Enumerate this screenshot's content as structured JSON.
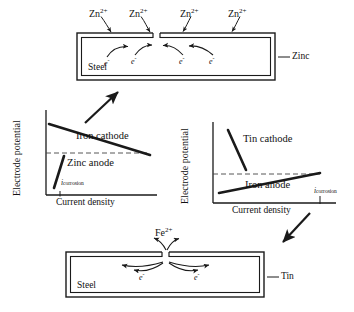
{
  "top_diagram": {
    "name": "galvanized-steel-diagram",
    "substrate_label": "Steel",
    "coating_label": "Zinc",
    "ion_labels": [
      "Zn2+",
      "Zn2+",
      "Zn2+",
      "Zn2+"
    ],
    "ion_display": "Zn",
    "ion_charge": "2+",
    "electron_label": "e",
    "electron_charge": "-",
    "electron_count": 4,
    "electron_direction": "toward-coating-gap"
  },
  "bottom_diagram": {
    "name": "tinplate-steel-diagram",
    "substrate_label": "Steel",
    "coating_label": "Tin",
    "ion_labels": [
      "Fe2+"
    ],
    "ion_display": "Fe",
    "ion_charge": "2+",
    "electron_label": "e",
    "electron_charge": "-",
    "electron_count": 2,
    "electron_direction": "away-from-coating-gap"
  },
  "left_chart": {
    "name": "zinc-polarization-chart",
    "ylabel": "Electrode potential",
    "xlabel": "Current density",
    "cathode_label": "Iron cathode",
    "anode_label": "Zinc anode",
    "corrosion_label": "i",
    "corrosion_subscript": "corrosion",
    "cathode_slope": "shallow-descending",
    "anode_slope": "steep-ascending",
    "intersection_position": "right"
  },
  "right_chart": {
    "name": "tin-polarization-chart",
    "ylabel": "Electrode potential",
    "xlabel": "Current density",
    "cathode_label": "Tin cathode",
    "anode_label": "Iron anode",
    "corrosion_label": "i",
    "corrosion_subscript": "corrosion",
    "cathode_slope": "steep-descending",
    "anode_slope": "shallow-ascending",
    "intersection_position": "far-right"
  },
  "connectors": {
    "left_to_top": "arrow-up-right",
    "right_to_bottom": "arrow-down-left"
  },
  "colors": {
    "line": "#1a1a1a",
    "dashed": "#555555",
    "background": "#ffffff",
    "box_fill": "#ffffff"
  }
}
